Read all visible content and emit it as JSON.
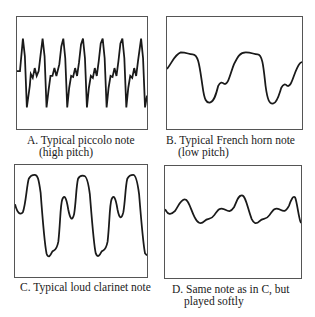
{
  "panels": [
    {
      "id": "A",
      "caption_line1": "A. Typical piccolo note",
      "caption_line2": "(high pitch)",
      "waveform": "piccolo-high-pitch"
    },
    {
      "id": "B",
      "caption_line1": "B. Typical French horn note",
      "caption_line2": "(low pitch)",
      "waveform": "french-horn-low-pitch"
    },
    {
      "id": "C",
      "caption_line1": "C. Typical loud clarinet note",
      "caption_line2": "",
      "waveform": "clarinet-loud"
    },
    {
      "id": "D",
      "caption_line1": "D. Same note as in C, but",
      "caption_line2": "played softly",
      "waveform": "clarinet-soft"
    }
  ],
  "colors": {
    "line": "#1a1a1a",
    "frame": "#555555",
    "background": "#ffffff"
  }
}
